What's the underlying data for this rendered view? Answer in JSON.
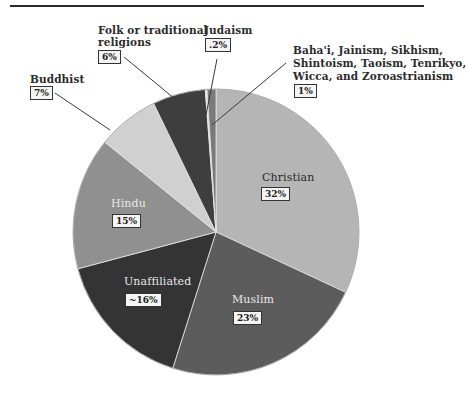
{
  "chart_data": {
    "type": "pie",
    "title": "",
    "start_angle_deg": 0,
    "direction": "clockwise",
    "slices": [
      {
        "label": "Christian",
        "display": "32%",
        "value": 32,
        "color": "#b5b5b5"
      },
      {
        "label": "Muslim",
        "display": "23%",
        "value": 23,
        "color": "#5c5c5c"
      },
      {
        "label": "Unaffiliated",
        "display": "~16%",
        "value": 16,
        "color": "#343434"
      },
      {
        "label": "Hindu",
        "display": "15%",
        "value": 15,
        "color": "#909090"
      },
      {
        "label": "Buddhist",
        "display": "7%",
        "value": 7,
        "color": "#d0d0d0"
      },
      {
        "label": "Folk or traditional religions",
        "display": "6%",
        "value": 6,
        "color": "#3e3e3e"
      },
      {
        "label": "Judaism",
        "display": ".2%",
        "value": 0.2,
        "color": "#e4e4e4"
      },
      {
        "label": "Baha'i, Jainism, Sikhism, Shintoism, Taoism, Tenrikyo, Wicca, and Zoroastrianism",
        "display": "1%",
        "value": 1,
        "color": "#7a7a7a"
      }
    ],
    "legend": "none (direct labels with leader lines)"
  },
  "labels": {
    "christian": {
      "name": "Christian",
      "pct": "32%"
    },
    "muslim": {
      "name": "Muslim",
      "pct": "23%"
    },
    "unaffiliated": {
      "name": "Unaffiliated",
      "pct": "~16%"
    },
    "hindu": {
      "name": "Hindu",
      "pct": "15%"
    },
    "buddhist": {
      "name": "Buddhist",
      "pct": "7%"
    },
    "folk": {
      "line1": "Folk or traditional",
      "line2": "religions",
      "pct": "6%"
    },
    "judaism": {
      "name": "Judaism",
      "pct": ".2%"
    },
    "other": {
      "line1": "Baha'i, Jainism, Sikhism,",
      "line2": "Shintoism, Taoism, Tenrikyo,",
      "line3": "Wicca, and Zoroastrianism",
      "pct": "1%"
    }
  }
}
